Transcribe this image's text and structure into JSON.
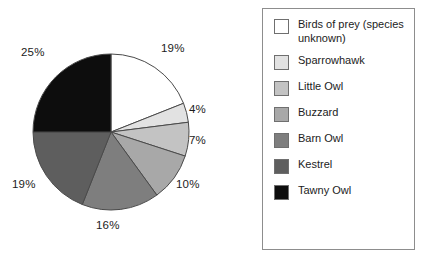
{
  "chart_data": {
    "type": "pie",
    "title": "",
    "subtitle": "",
    "xlabel": "",
    "ylabel": "",
    "legend_position": "right",
    "grid": false,
    "start_angle_deg": 0,
    "direction": "clockwise",
    "categories": [
      "Birds of prey (species unknown)",
      "Sparrowhawk",
      "Little Owl",
      "Buzzard",
      "Barn Owl",
      "Kestrel",
      "Tawny Owl"
    ],
    "values": [
      19,
      4,
      7,
      10,
      16,
      19,
      25
    ],
    "value_labels": [
      "19%",
      "4%",
      "7%",
      "10%",
      "16%",
      "19%",
      "25%"
    ],
    "colors": [
      "#ffffff",
      "#e2e2e2",
      "#c3c3c3",
      "#a8a8a8",
      "#7e7e7e",
      "#5e5e5e",
      "#0d0d0d"
    ],
    "slice_border_color": "#4a4a4a"
  },
  "pie": {
    "labels": [
      {
        "text": "19%",
        "left": 161,
        "top": 43
      },
      {
        "text": "4%",
        "left": 189,
        "top": 104
      },
      {
        "text": "7%",
        "left": 189,
        "top": 135
      },
      {
        "text": "10%",
        "left": 176,
        "top": 179
      },
      {
        "text": "16%",
        "left": 96,
        "top": 220
      },
      {
        "text": "19%",
        "left": 12,
        "top": 179
      },
      {
        "text": "25%",
        "left": 21,
        "top": 47
      }
    ]
  },
  "legend": {
    "items": [
      {
        "label": "Birds of prey (species unknown)",
        "color": "#ffffff",
        "swatch_name": "legend-swatch-birds-of-prey"
      },
      {
        "label": "Sparrowhawk",
        "color": "#e2e2e2",
        "swatch_name": "legend-swatch-sparrowhawk"
      },
      {
        "label": "Little Owl",
        "color": "#c3c3c3",
        "swatch_name": "legend-swatch-little-owl"
      },
      {
        "label": "Buzzard",
        "color": "#a8a8a8",
        "swatch_name": "legend-swatch-buzzard"
      },
      {
        "label": "Barn Owl",
        "color": "#7e7e7e",
        "swatch_name": "legend-swatch-barn-owl"
      },
      {
        "label": "Kestrel",
        "color": "#5e5e5e",
        "swatch_name": "legend-swatch-kestrel"
      },
      {
        "label": "Tawny Owl",
        "color": "#0d0d0d",
        "swatch_name": "legend-swatch-tawny-owl"
      }
    ]
  }
}
